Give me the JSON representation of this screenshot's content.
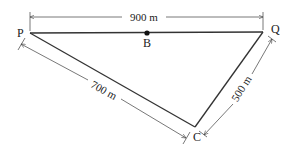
{
  "diagram": {
    "type": "triangle-with-dimensions",
    "points": {
      "P": {
        "label": "P"
      },
      "Q": {
        "label": "Q"
      },
      "C": {
        "label": "C"
      },
      "B": {
        "label": "B"
      }
    },
    "dimensions": {
      "PQ": "900 m",
      "PC": "700 m",
      "QC": "500 m"
    },
    "colors": {
      "line": "#333333",
      "dim_line": "#555555",
      "background": "#ffffff"
    }
  }
}
